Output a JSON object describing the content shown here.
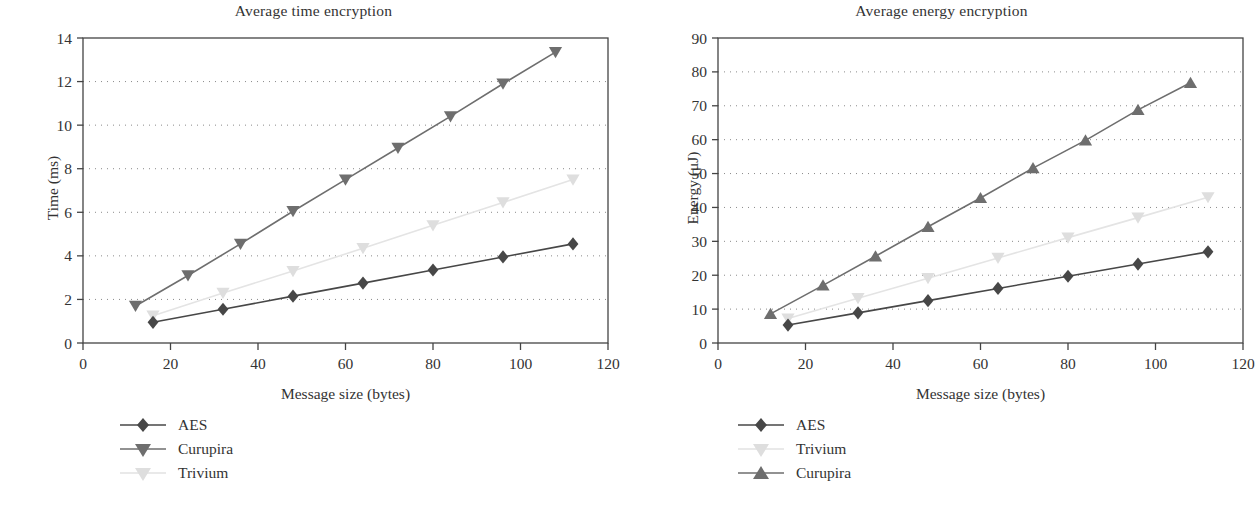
{
  "figure": {
    "width": 1255,
    "height": 512,
    "background": "#ffffff"
  },
  "panels": [
    {
      "id": "time-panel",
      "title": "Average time encryption",
      "xlabel": "Message size (bytes)",
      "ylabel": "Time (ms)",
      "legend": [
        {
          "label": "AES",
          "marker": "diamond",
          "color": "#474747"
        },
        {
          "label": "Curupira",
          "marker": "triangle-down",
          "color": "#6e6e6e"
        },
        {
          "label": "Trivium",
          "marker": "triangle-down",
          "color": "#dedede"
        }
      ]
    },
    {
      "id": "energy-panel",
      "title": "Average energy encryption",
      "xlabel": "Message size (bytes)",
      "ylabel": "Energy (μJ)",
      "legend": [
        {
          "label": "AES",
          "marker": "diamond",
          "color": "#474747"
        },
        {
          "label": "Trivium",
          "marker": "triangle-down",
          "color": "#dedede"
        },
        {
          "label": "Curupira",
          "marker": "triangle-up",
          "color": "#6e6e6e"
        }
      ]
    }
  ],
  "chart_data": [
    {
      "type": "line",
      "title": "Average time encryption",
      "xlabel": "Message size (bytes)",
      "ylabel": "Time (ms)",
      "xlim": [
        0,
        120
      ],
      "ylim": [
        0,
        14
      ],
      "xticks": [
        0,
        20,
        40,
        60,
        80,
        100,
        120
      ],
      "yticks": [
        0,
        2,
        4,
        6,
        8,
        10,
        12,
        14
      ],
      "grid": "horizontal-dotted",
      "legend_position": "below-left",
      "series": [
        {
          "name": "AES",
          "marker": "diamond",
          "color": "#474747",
          "x": [
            16,
            32,
            48,
            64,
            80,
            96,
            112
          ],
          "values": [
            0.95,
            1.55,
            2.15,
            2.75,
            3.35,
            3.95,
            4.55
          ]
        },
        {
          "name": "Curupira",
          "marker": "triangle-down",
          "color": "#6e6e6e",
          "x": [
            12,
            24,
            36,
            48,
            60,
            72,
            84,
            96,
            108
          ],
          "values": [
            1.7,
            3.1,
            4.55,
            6.05,
            7.5,
            8.95,
            10.4,
            11.9,
            13.35
          ]
        },
        {
          "name": "Trivium",
          "marker": "triangle-down",
          "color": "#dedede",
          "x": [
            16,
            32,
            48,
            64,
            80,
            96,
            112
          ],
          "values": [
            1.25,
            2.3,
            3.3,
            4.35,
            5.4,
            6.45,
            7.5
          ]
        }
      ]
    },
    {
      "type": "line",
      "title": "Average energy encryption",
      "xlabel": "Message size (bytes)",
      "ylabel": "Energy (μJ)",
      "xlim": [
        0,
        120
      ],
      "ylim": [
        0,
        90
      ],
      "xticks": [
        0,
        20,
        40,
        60,
        80,
        100,
        120
      ],
      "yticks": [
        0,
        10,
        20,
        30,
        40,
        50,
        60,
        70,
        80,
        90
      ],
      "grid": "horizontal-dotted",
      "legend_position": "below-left",
      "series": [
        {
          "name": "AES",
          "marker": "diamond",
          "color": "#474747",
          "x": [
            16,
            32,
            48,
            64,
            80,
            96,
            112
          ],
          "values": [
            5.3,
            8.9,
            12.5,
            16.1,
            19.7,
            23.3,
            26.9
          ]
        },
        {
          "name": "Trivium",
          "marker": "triangle-down",
          "color": "#dedede",
          "x": [
            16,
            32,
            48,
            64,
            80,
            96,
            112
          ],
          "values": [
            7.2,
            13.2,
            19.1,
            25.1,
            31.1,
            37.0,
            43.0
          ]
        },
        {
          "name": "Curupira",
          "marker": "triangle-up",
          "color": "#6e6e6e",
          "x": [
            12,
            24,
            36,
            48,
            60,
            72,
            84,
            96,
            108
          ],
          "values": [
            8.6,
            17.0,
            25.6,
            34.3,
            42.8,
            51.6,
            59.8,
            68.8,
            76.8
          ]
        }
      ]
    }
  ]
}
